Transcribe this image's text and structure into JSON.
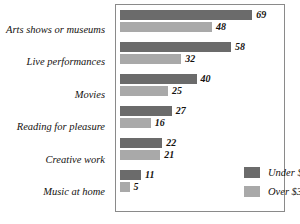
{
  "chart_data": {
    "type": "bar",
    "orientation": "horizontal",
    "title": "",
    "xlabel": "",
    "ylabel": "",
    "categories": [
      "Arts shows or museums",
      "Live performances",
      "Movies",
      "Reading for pleasure",
      "Creative work",
      "Music at home"
    ],
    "series": [
      {
        "name": "Under $35,000",
        "color": "#6b6b6b",
        "values": [
          69,
          58,
          40,
          27,
          22,
          11
        ]
      },
      {
        "name": "Over $35,000",
        "color": "#a9a9a9",
        "values": [
          48,
          32,
          25,
          16,
          21,
          5
        ]
      }
    ],
    "xlim": [
      0,
      72
    ],
    "grid": false,
    "legend_position": "inside-bottom-right",
    "value_labels": true
  },
  "legend": {
    "items": [
      {
        "label": "Under $35,000",
        "color": "#6b6b6b"
      },
      {
        "label": "Over $35,000",
        "color": "#a9a9a9"
      }
    ]
  }
}
